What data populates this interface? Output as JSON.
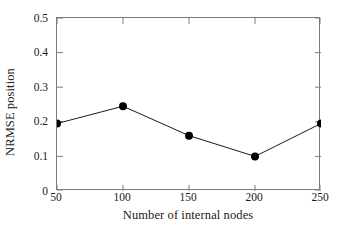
{
  "chart_data": {
    "type": "line",
    "title": "",
    "subtitle": "",
    "xlabel": "Number of internal nodes",
    "ylabel": "NRMSE position",
    "x": [
      50,
      100,
      150,
      200,
      250
    ],
    "values": [
      0.195,
      0.245,
      0.16,
      0.1,
      0.195
    ],
    "series": [
      {
        "name": "NRMSE position",
        "x": [
          50,
          100,
          150,
          200,
          250
        ],
        "values": [
          0.195,
          0.245,
          0.16,
          0.1,
          0.195
        ]
      }
    ],
    "xlim": [
      50,
      250
    ],
    "ylim": [
      0,
      0.5
    ],
    "xticks": [
      50,
      100,
      150,
      200,
      250
    ],
    "yticks": [
      0,
      0.1,
      0.2,
      0.3,
      0.4,
      0.5
    ],
    "xtick_labels": [
      "50",
      "100",
      "150",
      "200",
      "250"
    ],
    "ytick_labels": [
      "0",
      "0.1",
      "0.2",
      "0.3",
      "0.4",
      "0.5"
    ],
    "grid": false,
    "legend": false,
    "legend_position": "none",
    "marker": "filled-circle",
    "line_color": "#1a1a1a",
    "marker_color": "#000000",
    "axis_color": "#7b7b7b",
    "background_color": "#ffffff"
  }
}
